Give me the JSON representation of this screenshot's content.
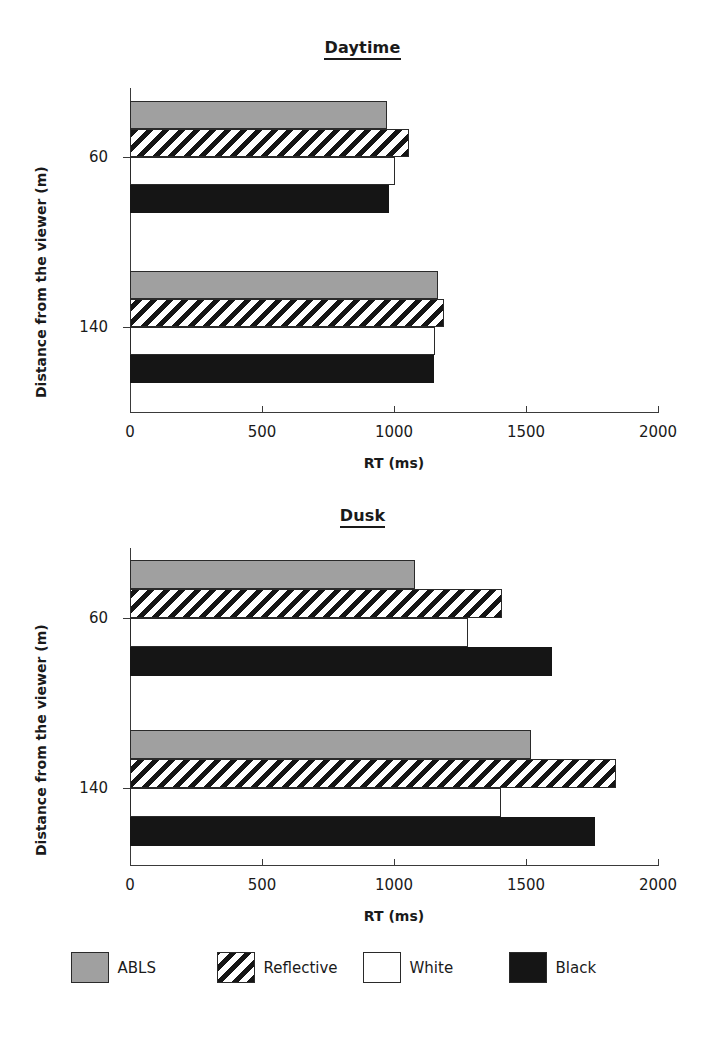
{
  "figure": {
    "panels": [
      {
        "title": "Daytime",
        "xlabel": "RT (ms)",
        "ylabel": "Distance from the viewer (m)"
      },
      {
        "title": "Dusk",
        "xlabel": "RT (ms)",
        "ylabel": "Distance from the viewer (m)"
      }
    ]
  },
  "axis": {
    "xticks": [
      "0",
      "500",
      "1000",
      "1500",
      "2000"
    ],
    "yticks": [
      "60",
      "140"
    ]
  },
  "legend": {
    "items": [
      {
        "label": "ABLS",
        "swatch": "solid-gray-swatch",
        "color": "#a0a0a0"
      },
      {
        "label": "Reflective",
        "swatch": "diagonal-hatch-swatch",
        "color": "#ffffff"
      },
      {
        "label": "White",
        "swatch": "solid-white-swatch",
        "color": "#ffffff"
      },
      {
        "label": "Black",
        "swatch": "solid-black-swatch",
        "color": "#151515"
      }
    ]
  },
  "chart_data": [
    {
      "type": "bar",
      "title": "Daytime",
      "orientation": "horizontal",
      "xlabel": "RT (ms)",
      "ylabel": "Distance from the viewer (m)",
      "xlim": [
        0,
        2000
      ],
      "xticks": [
        0,
        500,
        1000,
        1500,
        2000
      ],
      "categories": [
        "60",
        "140"
      ],
      "grid": false,
      "legend_position": "bottom",
      "series": [
        {
          "name": "ABLS",
          "values": [
            975,
            1165
          ]
        },
        {
          "name": "Reflective",
          "values": [
            1055,
            1190
          ]
        },
        {
          "name": "White",
          "values": [
            1005,
            1155
          ]
        },
        {
          "name": "Black",
          "values": [
            980,
            1150
          ]
        }
      ]
    },
    {
      "type": "bar",
      "title": "Dusk",
      "orientation": "horizontal",
      "xlabel": "RT (ms)",
      "ylabel": "Distance from the viewer (m)",
      "xlim": [
        0,
        2000
      ],
      "xticks": [
        0,
        500,
        1000,
        1500,
        2000
      ],
      "categories": [
        "60",
        "140"
      ],
      "grid": false,
      "legend_position": "bottom",
      "series": [
        {
          "name": "ABLS",
          "values": [
            1080,
            1520
          ]
        },
        {
          "name": "Reflective",
          "values": [
            1410,
            1840
          ]
        },
        {
          "name": "White",
          "values": [
            1280,
            1405
          ]
        },
        {
          "name": "Black",
          "values": [
            1600,
            1760
          ]
        }
      ]
    }
  ]
}
